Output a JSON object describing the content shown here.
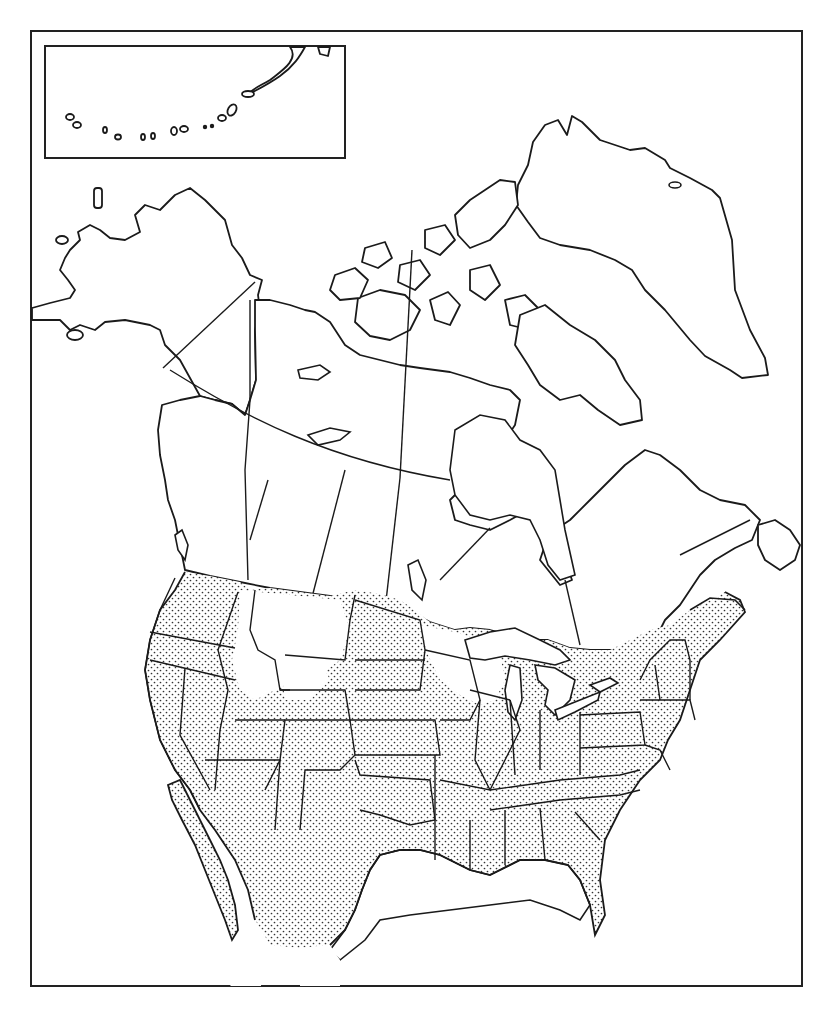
{
  "map": {
    "type": "range map",
    "region": "North America",
    "style": "black-and-white outline with stipple shading",
    "colors": {
      "ink": "#1a1a1a",
      "paper": "#ffffff",
      "stipple": "#333333"
    },
    "inset": {
      "subject": "Aleutian Islands",
      "position": "top-left"
    },
    "shaded_range": {
      "description": "Stippled area covering most of the contiguous United States and northern Mexico, extending into southern Canada near the Great Lakes, St. Lawrence and Maritimes",
      "unshaded_pockets": [
        "northern Idaho / western Montana",
        "northwestern Wyoming",
        "northern Minnesota / Wisconsin / Upper Michigan"
      ]
    }
  }
}
